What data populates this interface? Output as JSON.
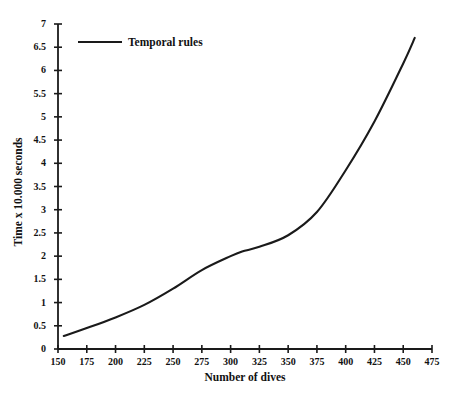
{
  "chart_data": {
    "type": "line",
    "title": "",
    "xlabel": "Number of dives",
    "ylabel": "Time x 10.000 seconds",
    "xlim": [
      150,
      475
    ],
    "ylim": [
      0,
      7
    ],
    "grid": false,
    "legend_position": "top-left",
    "xticks": [
      150,
      175,
      200,
      225,
      250,
      275,
      300,
      325,
      350,
      375,
      400,
      425,
      450,
      475
    ],
    "xtick_labels": [
      "150",
      "175",
      "200",
      "225",
      "250",
      "275",
      "300",
      "325",
      "350",
      "375",
      "400",
      "425",
      "450",
      "475"
    ],
    "yticks": [
      0,
      0.5,
      1,
      1.5,
      2,
      2.5,
      3,
      3.5,
      4,
      4.5,
      5,
      5.5,
      6,
      6.5,
      7
    ],
    "ytick_labels": [
      "0",
      "0.5",
      "1",
      "1.5",
      "2",
      "2.5",
      "3",
      "3.5",
      "4",
      "4.5",
      "5",
      "5.5",
      "6",
      "6.5",
      "7"
    ],
    "series": [
      {
        "name": "Temporal rules",
        "color": "#1a1a1a",
        "x": [
          155,
          175,
          200,
          225,
          250,
          275,
          300,
          310,
          325,
          350,
          375,
          400,
          425,
          450,
          460
        ],
        "values": [
          0.28,
          0.45,
          0.68,
          0.95,
          1.3,
          1.7,
          2.0,
          2.1,
          2.2,
          2.45,
          2.95,
          3.85,
          4.9,
          6.15,
          6.7
        ]
      }
    ]
  },
  "legend": {
    "entries": [
      {
        "label": "Temporal rules",
        "color": "#1a1a1a"
      }
    ]
  },
  "axes": {
    "x_title": "Number of dives",
    "y_title": "Time x 10.000 seconds"
  },
  "style": {
    "line_color": "#1a1a1a",
    "axis_color": "#1a1a1a",
    "background": "#ffffff",
    "text_color": "#111111"
  }
}
